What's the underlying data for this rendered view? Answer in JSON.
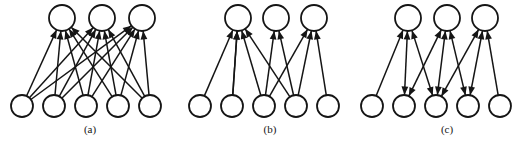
{
  "figure": {
    "background_color": "#ffffff",
    "stroke_color": "#151515",
    "width": 531,
    "height": 142
  },
  "panels": [
    {
      "id": "panel-a",
      "caption": "(a)",
      "caption_x": 90,
      "caption_y": 133,
      "description": "fully connected feedforward layer",
      "top_nodes": [
        {
          "label": "",
          "cx": 62,
          "cy": 18,
          "r": 13
        },
        {
          "label": "",
          "cx": 102,
          "cy": 18,
          "r": 13
        },
        {
          "label": "",
          "cx": 142,
          "cy": 18,
          "r": 13
        }
      ],
      "bottom_nodes": [
        {
          "label": "",
          "cx": 22,
          "cy": 106,
          "r": 11
        },
        {
          "label": "",
          "cx": 54,
          "cy": 106,
          "r": 11
        },
        {
          "label": "",
          "cx": 86,
          "cy": 106,
          "r": 11
        },
        {
          "label": "",
          "cx": 118,
          "cy": 106,
          "r": 11
        },
        {
          "label": "",
          "cx": 150,
          "cy": 106,
          "r": 11
        }
      ],
      "edges": [
        {
          "from": 0,
          "to": 0,
          "direction": "up"
        },
        {
          "from": 0,
          "to": 1,
          "direction": "up"
        },
        {
          "from": 0,
          "to": 2,
          "direction": "up"
        },
        {
          "from": 1,
          "to": 0,
          "direction": "up"
        },
        {
          "from": 1,
          "to": 1,
          "direction": "up"
        },
        {
          "from": 1,
          "to": 2,
          "direction": "up"
        },
        {
          "from": 2,
          "to": 0,
          "direction": "up"
        },
        {
          "from": 2,
          "to": 1,
          "direction": "up"
        },
        {
          "from": 2,
          "to": 2,
          "direction": "up"
        },
        {
          "from": 3,
          "to": 0,
          "direction": "up"
        },
        {
          "from": 3,
          "to": 1,
          "direction": "up"
        },
        {
          "from": 3,
          "to": 2,
          "direction": "up"
        },
        {
          "from": 4,
          "to": 0,
          "direction": "up"
        },
        {
          "from": 4,
          "to": 1,
          "direction": "up"
        },
        {
          "from": 4,
          "to": 2,
          "direction": "up"
        }
      ]
    },
    {
      "id": "panel-b",
      "caption": "(b)",
      "caption_x": 270,
      "caption_y": 133,
      "description": "sparsely connected feedforward layer",
      "top_nodes": [
        {
          "label": "",
          "cx": 238,
          "cy": 18,
          "r": 13
        },
        {
          "label": "",
          "cx": 276,
          "cy": 18,
          "r": 13
        },
        {
          "label": "",
          "cx": 314,
          "cy": 18,
          "r": 13
        }
      ],
      "bottom_nodes": [
        {
          "label": "",
          "cx": 200,
          "cy": 106,
          "r": 11
        },
        {
          "label": "",
          "cx": 232,
          "cy": 106,
          "r": 11
        },
        {
          "label": "",
          "cx": 264,
          "cy": 106,
          "r": 11
        },
        {
          "label": "",
          "cx": 296,
          "cy": 106,
          "r": 11
        },
        {
          "label": "",
          "cx": 328,
          "cy": 106,
          "r": 11
        }
      ],
      "edges": [
        {
          "from": 0,
          "to": 0,
          "direction": "up"
        },
        {
          "from": 1,
          "to": 0,
          "direction": "up"
        },
        {
          "from": 1,
          "to": 0,
          "direction": "up"
        },
        {
          "from": 2,
          "to": 0,
          "direction": "up"
        },
        {
          "from": 2,
          "to": 1,
          "direction": "up"
        },
        {
          "from": 3,
          "to": 1,
          "direction": "up"
        },
        {
          "from": 3,
          "to": 2,
          "direction": "up"
        },
        {
          "from": 2,
          "to": 2,
          "direction": "up"
        },
        {
          "from": 3,
          "to": 0,
          "direction": "up"
        },
        {
          "from": 4,
          "to": 2,
          "direction": "up"
        }
      ]
    },
    {
      "id": "panel-c",
      "caption": "(c)",
      "caption_x": 447,
      "caption_y": 133,
      "description": "bidirectionally connected layer",
      "top_nodes": [
        {
          "label": "",
          "cx": 408,
          "cy": 18,
          "r": 13
        },
        {
          "label": "",
          "cx": 447,
          "cy": 18,
          "r": 13
        },
        {
          "label": "",
          "cx": 485,
          "cy": 18,
          "r": 13
        }
      ],
      "bottom_nodes": [
        {
          "label": "",
          "cx": 372,
          "cy": 106,
          "r": 11
        },
        {
          "label": "",
          "cx": 404,
          "cy": 106,
          "r": 11
        },
        {
          "label": "",
          "cx": 436,
          "cy": 106,
          "r": 11
        },
        {
          "label": "",
          "cx": 468,
          "cy": 106,
          "r": 11
        },
        {
          "label": "",
          "cx": 500,
          "cy": 106,
          "r": 11
        }
      ],
      "edges": [
        {
          "from": 0,
          "to": 0,
          "direction": "up"
        },
        {
          "from": 1,
          "to": 0,
          "direction": "both"
        },
        {
          "from": 2,
          "to": 0,
          "direction": "both"
        },
        {
          "from": 1,
          "to": 1,
          "direction": "both"
        },
        {
          "from": 2,
          "to": 1,
          "direction": "both"
        },
        {
          "from": 3,
          "to": 1,
          "direction": "both"
        },
        {
          "from": 2,
          "to": 2,
          "direction": "both"
        },
        {
          "from": 3,
          "to": 2,
          "direction": "both"
        },
        {
          "from": 4,
          "to": 2,
          "direction": "up"
        }
      ]
    }
  ]
}
